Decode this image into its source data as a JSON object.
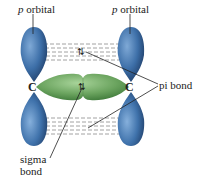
{
  "labels": {
    "p_orbital_left_italic": "p",
    "p_orbital_left_rest": " orbital",
    "p_orbital_right_italic": "p",
    "p_orbital_right_rest": " orbital",
    "pi_bond": "pi bond",
    "sigma_bond_line1": "sigma",
    "sigma_bond_line2": "bond",
    "carbon_left": "C",
    "carbon_right": "C",
    "electron_pair_top": "⇅",
    "electron_pair_mid": "⇅"
  },
  "colors": {
    "p_orbital_blue": "#3d6fa8",
    "p_orbital_dark": "#1d3a63",
    "sigma_green": "#6aa35e",
    "sigma_dark": "#3f7a3a",
    "dashes": "#8a8a8a",
    "leader_lines": "#222222"
  }
}
